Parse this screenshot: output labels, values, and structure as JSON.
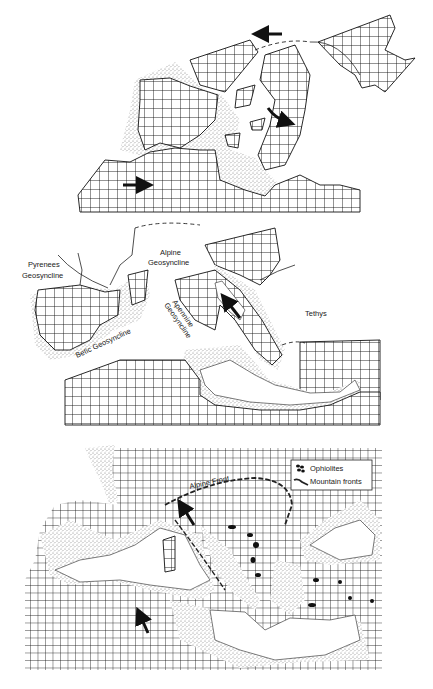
{
  "figure": {
    "panels": [
      {
        "id": "top",
        "labels": [],
        "arrows": [
          {
            "direction": "west",
            "note": "northern plate arrow"
          },
          {
            "direction": "east",
            "note": "African plate arrow"
          },
          {
            "direction": "curved-clockwise",
            "note": "Adriatic rotation arrow"
          }
        ]
      },
      {
        "id": "middle",
        "labels": {
          "pyrenees": "Pyrenees Geosyncline",
          "pyrenees_line1": "Pyrenees",
          "pyrenees_line2": "Geosyncline",
          "alpine_line1": "Alpine",
          "alpine_line2": "Geosyncline",
          "apennine_line1": "Apennine",
          "apennine_line2": "Geosyncline",
          "betic": "Betic Geosyncline",
          "tethys": "Tethys"
        },
        "arrows": [
          {
            "direction": "north-west",
            "note": "Adriatic arrow"
          }
        ]
      },
      {
        "id": "bottom",
        "labels": {
          "alpine_front": "Alpine Front"
        },
        "legend": {
          "items": [
            {
              "symbol": "ophiolite-icon",
              "label": "Ophiolites"
            },
            {
              "symbol": "mountain-front-icon",
              "label": "Mountain fronts"
            }
          ]
        },
        "arrows": [
          {
            "direction": "north-north-west",
            "note": "Africa motion arrow"
          },
          {
            "direction": "north-north-west",
            "note": "Adriatic indenter arrow"
          }
        ]
      }
    ]
  },
  "colors": {
    "ink": "#111111",
    "paper": "#ffffff",
    "stipple": "#888888"
  }
}
